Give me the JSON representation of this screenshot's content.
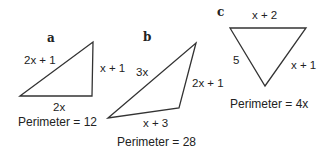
{
  "figure": {
    "triangles": [
      {
        "id": "a",
        "label": "a",
        "sides": {
          "hypotenuse": "2x + 1",
          "right": "x + 1",
          "bottom": "2x"
        },
        "perimeter": "Perimeter = 12"
      },
      {
        "id": "b",
        "label": "b",
        "sides": {
          "left": "3x",
          "right": "2x + 1",
          "bottom": "x + 3"
        },
        "perimeter": "Perimeter = 28"
      },
      {
        "id": "c",
        "label": "c",
        "sides": {
          "top": "x + 2",
          "left": "5",
          "right": "x + 1"
        },
        "perimeter": "Perimeter = 4x"
      }
    ],
    "colors": {
      "stroke": "#333333",
      "text": "#222222",
      "background": "#ffffff"
    }
  }
}
